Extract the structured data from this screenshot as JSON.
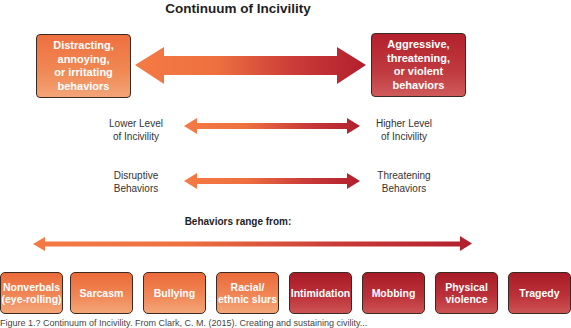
{
  "title": "Continuum of Incivility",
  "colors": {
    "low_end": "#f07a45",
    "high_end": "#b3212c",
    "text_dark": "#333333",
    "border": "#3a2a22"
  },
  "top_boxes": {
    "left": "Distracting, annoying, or irritating behaviors",
    "left_lines": [
      "Distracting,",
      "annoying,",
      "or irritating",
      "behaviors"
    ],
    "right": "Aggressive, threatening, or violent behaviors",
    "right_lines": [
      "Aggressive,",
      "threatening,",
      "or violent",
      "behaviors"
    ]
  },
  "scales": [
    {
      "left_lines": [
        "Lower Level",
        "of Incivility"
      ],
      "right_lines": [
        "Higher Level",
        "of Incivility"
      ]
    },
    {
      "left_lines": [
        "Disruptive",
        "Behaviors"
      ],
      "right_lines": [
        "Threatening",
        "Behaviors"
      ]
    }
  ],
  "range_label": "Behaviors range from:",
  "behaviors": [
    {
      "lines": [
        "Nonverbals",
        "(eye-rolling)"
      ],
      "level": "low"
    },
    {
      "lines": [
        "Sarcasm"
      ],
      "level": "low"
    },
    {
      "lines": [
        "Bullying"
      ],
      "level": "low"
    },
    {
      "lines": [
        "Racial/",
        "ethnic slurs"
      ],
      "level": "low"
    },
    {
      "lines": [
        "Intimidation"
      ],
      "level": "high"
    },
    {
      "lines": [
        "Mobbing"
      ],
      "level": "high"
    },
    {
      "lines": [
        "Physical",
        "violence"
      ],
      "level": "high"
    },
    {
      "lines": [
        "Tragedy"
      ],
      "level": "high"
    }
  ],
  "caption_partial": "Figure 1.? Continuum of Incivility. From Clark, C. M. (2015). Creating and sustaining civility..."
}
